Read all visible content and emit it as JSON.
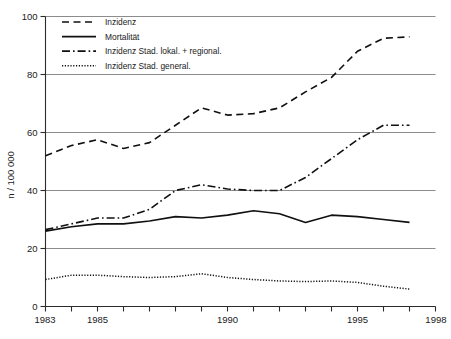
{
  "chart_data": {
    "type": "line",
    "title": "",
    "xlabel": "",
    "ylabel": "n / 100 000",
    "xlim": [
      1983,
      1998
    ],
    "ylim": [
      0,
      100
    ],
    "grid": true,
    "legend_position": "top-left",
    "y_ticks": [
      "0",
      "20",
      "40",
      "60",
      "80",
      "100"
    ],
    "y_tick_values": [
      0,
      20,
      40,
      60,
      80,
      100
    ],
    "x_ticks": [
      "1983",
      "1985",
      "1990",
      "1995",
      "1998"
    ],
    "x_tick_values": [
      1983,
      1985,
      1990,
      1995,
      1998
    ],
    "x_minor_ticks": [
      1984,
      1986,
      1987,
      1988,
      1989,
      1991,
      1992,
      1993,
      1994,
      1996,
      1997
    ],
    "x": [
      1983,
      1984,
      1985,
      1986,
      1987,
      1988,
      1989,
      1990,
      1991,
      1992,
      1993,
      1994,
      1995,
      1996,
      1997
    ],
    "series": [
      {
        "name": "Inzidenz",
        "style": "dashed",
        "values": [
          52.0,
          55.5,
          57.5,
          54.5,
          56.5,
          62.5,
          68.5,
          66.0,
          66.5,
          68.5,
          74.0,
          79.0,
          88.0,
          92.5,
          93.0
        ]
      },
      {
        "name": "Mortalität",
        "style": "solid",
        "values": [
          26.0,
          27.5,
          28.5,
          28.5,
          29.5,
          31.0,
          30.5,
          31.5,
          33.0,
          32.0,
          29.0,
          31.5,
          31.0,
          30.0,
          29.0
        ]
      },
      {
        "name": "Inzidenz Stad. lokal. + regional.",
        "style": "dashdot",
        "values": [
          26.5,
          28.5,
          30.5,
          30.5,
          33.5,
          40.0,
          42.0,
          40.5,
          40.0,
          40.0,
          44.5,
          51.0,
          57.5,
          62.5,
          62.5
        ]
      },
      {
        "name": "Inzidenz Stad. general.",
        "style": "dotted",
        "values": [
          9.3,
          10.8,
          10.8,
          10.3,
          10.0,
          10.3,
          11.3,
          10.0,
          9.3,
          8.8,
          8.6,
          8.8,
          8.3,
          7.0,
          6.0
        ]
      }
    ]
  },
  "legend": {
    "items": [
      {
        "label": "Inzidenz",
        "style": "dashed"
      },
      {
        "label": "Mortalität",
        "style": "solid"
      },
      {
        "label": "Inzidenz Stad. lokal. + regional.",
        "style": "dashdot"
      },
      {
        "label": "Inzidenz Stad. general.",
        "style": "dotted"
      }
    ]
  }
}
